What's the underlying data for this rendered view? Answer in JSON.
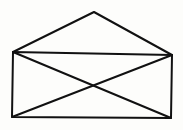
{
  "diagram": {
    "type": "line-drawing",
    "stroke_color": "#111111",
    "background": "#fdfdfb",
    "stroke_width": 2,
    "points": {
      "apex": [
        94,
        12
      ],
      "top_left": [
        13,
        52
      ],
      "top_right": [
        172,
        55
      ],
      "bottom_left": [
        12,
        117
      ],
      "bottom_right": [
        171,
        118
      ]
    }
  }
}
